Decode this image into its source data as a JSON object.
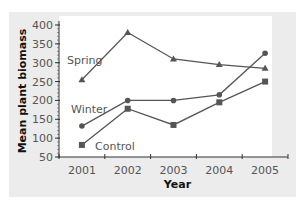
{
  "chart_data": {
    "type": "line",
    "title": "",
    "xlabel": "Year",
    "ylabel": "Mean plant biomass",
    "categories": [
      "2001",
      "2002",
      "2003",
      "2004",
      "2005"
    ],
    "ylim": [
      50,
      400
    ],
    "yticks": [
      50,
      100,
      150,
      200,
      250,
      300,
      350,
      400
    ],
    "grid": false,
    "legend": "inline labels",
    "series": [
      {
        "name": "Spring",
        "marker": "triangle",
        "values": [
          255,
          380,
          310,
          295,
          285
        ]
      },
      {
        "name": "Winter",
        "marker": "circle",
        "values": [
          132,
          200,
          200,
          215,
          325
        ]
      },
      {
        "name": "Control",
        "marker": "square",
        "values": [
          82,
          178,
          135,
          195,
          250
        ]
      }
    ],
    "colors": {
      "line": "#555555",
      "marker": "#555555",
      "panel": "#ececec",
      "plot": "#ffffff"
    }
  }
}
